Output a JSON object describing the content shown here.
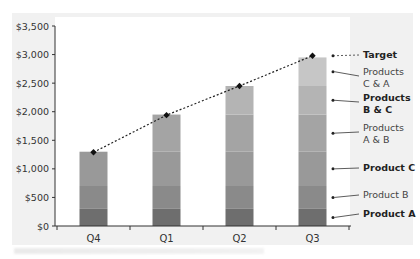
{
  "chart_data": {
    "type": "bar",
    "stacked": true,
    "title": "",
    "xlabel": "",
    "ylabel": "",
    "categories": [
      "Q4",
      "Q1",
      "Q2",
      "Q3"
    ],
    "ylim": [
      0,
      3500
    ],
    "yticks": [
      "$0",
      "$500",
      "$1,000",
      "$1,500",
      "$2,000",
      "$2,500",
      "$3,000",
      "$3,500"
    ],
    "ytick_values": [
      0,
      500,
      1000,
      1500,
      2000,
      2500,
      3000,
      3500
    ],
    "series": [
      {
        "name": "Product A",
        "values": [
          300,
          300,
          300,
          300
        ],
        "color": "#6e6e6e",
        "bold": true
      },
      {
        "name": "Product B",
        "values": [
          400,
          400,
          400,
          400
        ],
        "color": "#8a8a8a",
        "bold": false
      },
      {
        "name": "Product C",
        "values": [
          600,
          600,
          600,
          600
        ],
        "color": "#999999",
        "bold": true
      },
      {
        "name": "Products A & B",
        "values": [
          0,
          650,
          650,
          650
        ],
        "color": "#a4a4a4",
        "bold": false
      },
      {
        "name": "Products B & C",
        "values": [
          0,
          0,
          500,
          500
        ],
        "color": "#b4b4b4",
        "bold": true
      },
      {
        "name": "Products C & A",
        "values": [
          0,
          0,
          0,
          500
        ],
        "color": "#c6c6c6",
        "bold": false
      }
    ],
    "target": {
      "name": "Target",
      "values": [
        1290,
        1940,
        2450,
        2980
      ],
      "style": "dotted line with diamond markers"
    },
    "legend": {
      "position": "right",
      "entries": [
        {
          "lines": [
            "Target"
          ],
          "bold": true
        },
        {
          "lines": [
            "Products",
            "C & A"
          ],
          "bold": false
        },
        {
          "lines": [
            "Products",
            "B & C"
          ],
          "bold": true
        },
        {
          "lines": [
            "Products",
            "A & B"
          ],
          "bold": false
        },
        {
          "lines": [
            "Product C"
          ],
          "bold": true
        },
        {
          "lines": [
            "Product B"
          ],
          "bold": false
        },
        {
          "lines": [
            "Product A"
          ],
          "bold": true
        }
      ]
    },
    "grid": false
  }
}
